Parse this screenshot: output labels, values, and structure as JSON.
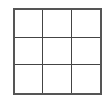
{
  "board": {
    "rows": 3,
    "cols": 3,
    "cells": [
      [
        "",
        "",
        ""
      ],
      [
        "",
        "",
        ""
      ],
      [
        "",
        "",
        ""
      ]
    ],
    "line_color": "#444444",
    "background": "#ffffff"
  }
}
